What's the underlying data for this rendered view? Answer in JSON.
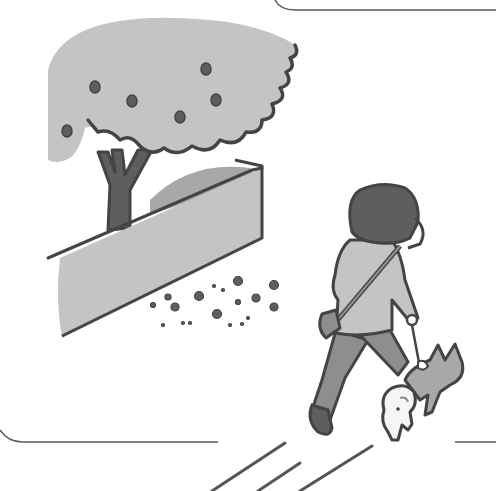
{
  "illustration": {
    "description": "Grayscale cartoon illustration of a woman walking a small shiba-like dog on a leash past a tree behind a low wall, with pebbles on the ground",
    "palette": {
      "outline": "#4a4a4a",
      "light_gray": "#c4c4c4",
      "mid_gray": "#9a9a9a",
      "dark_gray": "#5e5e5e",
      "background": "#ffffff"
    },
    "elements": [
      "panel-frame",
      "tree",
      "wall",
      "pebbles",
      "woman",
      "shoulder-bag",
      "leash",
      "dog",
      "path-lines"
    ]
  }
}
